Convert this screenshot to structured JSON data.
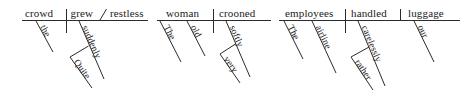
{
  "image": {
    "type": "sentence-diagram-set",
    "description": "Three Reed-Kellogg sentence diagrams",
    "width": 469,
    "height": 95,
    "background_color": "#ffffff",
    "ink_color": "#2b2b2b",
    "text_color": "#1a1a1a"
  },
  "diagrams": [
    {
      "id": "diagram-1",
      "sentence": "The crowd grew quite suddenly restless.",
      "subject": "crowd",
      "verb": "grew",
      "complement": "restless",
      "complement_type": "predicate-adjective",
      "divider_subject_verb": "vertical",
      "divider_verb_complement": "slanted",
      "modifiers": [
        {
          "word": "the",
          "attaches_to": "crowd",
          "level": 1
        },
        {
          "word": "suddenly",
          "attaches_to": "grew",
          "level": 1
        },
        {
          "word": "Quite",
          "attaches_to": "suddenly",
          "level": 2
        }
      ]
    },
    {
      "id": "diagram-2",
      "sentence": "The old woman crooned very softly.",
      "subject": "woman",
      "verb": "crooned",
      "complement": "",
      "complement_type": "none",
      "divider_subject_verb": "vertical",
      "divider_verb_complement": "none",
      "modifiers": [
        {
          "word": "The",
          "attaches_to": "woman",
          "level": 1
        },
        {
          "word": "old",
          "attaches_to": "woman",
          "level": 1
        },
        {
          "word": "softly",
          "attaches_to": "crooned",
          "level": 1
        },
        {
          "word": "very",
          "attaches_to": "softly",
          "level": 2
        }
      ]
    },
    {
      "id": "diagram-3",
      "sentence": "The airline employees handled our luggage rather carelessly.",
      "subject": "employees",
      "verb": "handled",
      "complement": "luggage",
      "complement_type": "direct-object",
      "divider_subject_verb": "vertical",
      "divider_verb_complement": "vertical",
      "modifiers": [
        {
          "word": "The",
          "attaches_to": "employees",
          "level": 1
        },
        {
          "word": "airline",
          "attaches_to": "employees",
          "level": 1
        },
        {
          "word": "carelessly",
          "attaches_to": "handled",
          "level": 1
        },
        {
          "word": "rather",
          "attaches_to": "carelessly",
          "level": 2
        },
        {
          "word": "our",
          "attaches_to": "luggage",
          "level": 1
        }
      ]
    }
  ],
  "labels": {
    "d1_subject": "crowd",
    "d1_verb": "grew",
    "d1_complement": "restless",
    "d1_mod_the": "the",
    "d1_mod_suddenly": "suddenly",
    "d1_mod_quite": "Quite",
    "d2_subject": "woman",
    "d2_verb": "crooned",
    "d2_mod_the": "The",
    "d2_mod_old": "old",
    "d2_mod_softly": "softly",
    "d2_mod_very": "very",
    "d3_subject": "employees",
    "d3_verb": "handled",
    "d3_complement": "luggage",
    "d3_mod_the": "The",
    "d3_mod_airline": "airline",
    "d3_mod_carelessly": "carelessly",
    "d3_mod_rather": "rather",
    "d3_mod_our": "our"
  }
}
